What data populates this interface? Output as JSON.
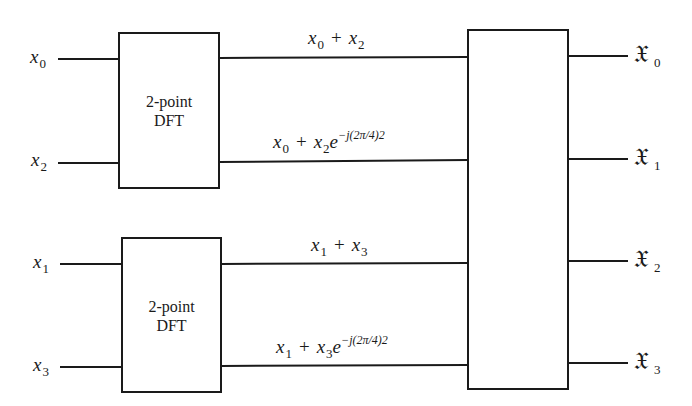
{
  "diagram": {
    "type": "signal-flow / block diagram",
    "inputs": [
      {
        "symbol": "x",
        "index": "0"
      },
      {
        "symbol": "x",
        "index": "2"
      },
      {
        "symbol": "x",
        "index": "1"
      },
      {
        "symbol": "x",
        "index": "3"
      }
    ],
    "blocks": [
      {
        "line1": "2-point",
        "line2": "DFT"
      },
      {
        "line1": "2-point",
        "line2": "DFT"
      }
    ],
    "intermediate": [
      {
        "a": "x",
        "a_idx": "0",
        "op": "+",
        "b": "x",
        "b_idx": "2",
        "twiddle": ""
      },
      {
        "a": "x",
        "a_idx": "0",
        "op": "+",
        "b": "x",
        "b_idx": "2",
        "base": "e",
        "twiddle": "−j(2π/4)2"
      },
      {
        "a": "x",
        "a_idx": "1",
        "op": "+",
        "b": "x",
        "b_idx": "3",
        "twiddle": ""
      },
      {
        "a": "x",
        "a_idx": "1",
        "op": "+",
        "b": "x",
        "b_idx": "3",
        "base": "e",
        "twiddle": "−j(2π/4)2"
      }
    ],
    "outputs": [
      {
        "symbol": "𝔛",
        "index": "0"
      },
      {
        "symbol": "𝔛",
        "index": "1"
      },
      {
        "symbol": "𝔛",
        "index": "2"
      },
      {
        "symbol": "𝔛",
        "index": "3"
      }
    ],
    "colors": {
      "stroke": "#1a1a1a",
      "background": "#ffffff"
    }
  }
}
